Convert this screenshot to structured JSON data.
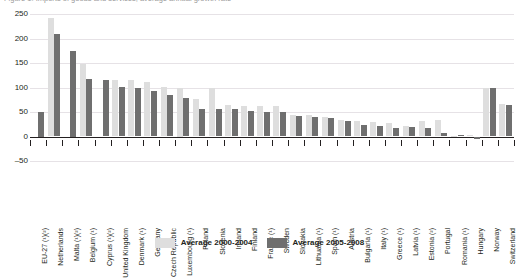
{
  "chart_data": {
    "type": "bar",
    "title": "Figure 1: Imports of goods and services, average annual growth rate",
    "xlabel": "",
    "ylabel": "",
    "ylim": [
      -50,
      250
    ],
    "yticks": [
      -50,
      0,
      50,
      100,
      150,
      200,
      250
    ],
    "grid": true,
    "legend_position": "bottom",
    "categories": [
      "EU-27 (¹)(²)",
      "Netherlands",
      "Malta (¹)(²)",
      "Belgium (¹)",
      "Cyprus (¹)(²)",
      "United Kingdom",
      "Denmark (¹)",
      "Germany",
      "Czech Republic",
      "Luxembourg (¹)",
      "Poland",
      "Slovenia",
      "Ireland",
      "Finland",
      "France (¹)",
      "Sweden",
      "Slovakia",
      "Lithuania (¹)",
      "Spain (¹)",
      "Austria",
      "Bulgaria (¹)",
      "Italy (¹)",
      "Greece (¹)",
      "Latvia (¹)",
      "Estonia (²)",
      "Portugal",
      "Romania (¹)",
      "Hungary",
      "Norway",
      "Switzerland"
    ],
    "series": [
      {
        "name": "Average 2000-2004",
        "color": "#dedede",
        "values": [
          null,
          241,
          null,
          148,
          null,
          115,
          115,
          111,
          101,
          100,
          77,
          99,
          64,
          63,
          62,
          63,
          43,
          43,
          39,
          34,
          32,
          29,
          28,
          21,
          32,
          33,
          2,
          3,
          99,
          66
        ]
      },
      {
        "name": "Average 2005-2008",
        "color": "#6f6f6f",
        "values": [
          50,
          210,
          175,
          118,
          115,
          101,
          98,
          93,
          85,
          78,
          57,
          57,
          56,
          53,
          51,
          49,
          42,
          40,
          37,
          31,
          24,
          21,
          18,
          20,
          17,
          8,
          4,
          -5,
          99,
          64
        ]
      }
    ]
  },
  "legend": {
    "items": [
      {
        "label": "Average 2000-2004",
        "color": "#dedede"
      },
      {
        "label": "Average 2005-2008",
        "color": "#6f6f6f"
      }
    ]
  }
}
